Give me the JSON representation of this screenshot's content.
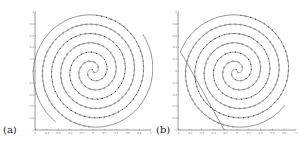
{
  "chart_data": [
    {
      "type": "scatter",
      "panel_label": "(a)",
      "title": "",
      "xlabel": "",
      "ylabel": "",
      "xlim": [
        -1,
        1
      ],
      "ylim": [
        -1,
        1
      ],
      "xticks": [
        "-1",
        "-0.8",
        "-0.6",
        "-0.4",
        "-0.2",
        "0",
        "0.2",
        "0.4",
        "0.6",
        "0.8",
        "1"
      ],
      "yticks": [
        "1",
        "0.8",
        "0.6",
        "0.4",
        "0.2",
        "0",
        "-0.2",
        "-0.4",
        "-0.6",
        "-0.8",
        "-1"
      ],
      "grid": false,
      "legend": null,
      "description": "Two interleaved spirals: points of class 1 as small filled dots, class 2 as small open circles; solid curve shows learned decision boundary spiral extending beyond top-right of frame",
      "series": [
        {
          "name": "class-1",
          "marker": "dot",
          "shape": "spiral",
          "phase_deg": 0,
          "turns": 3
        },
        {
          "name": "class-2",
          "marker": "circle",
          "shape": "spiral",
          "phase_deg": 180,
          "turns": 3
        },
        {
          "name": "decision-boundary",
          "marker": "line",
          "shape": "spiral",
          "phase_deg": 90,
          "turns": 3.4
        }
      ]
    },
    {
      "type": "scatter",
      "panel_label": "(b)",
      "title": "",
      "xlabel": "",
      "ylabel": "",
      "xlim": [
        -1,
        1
      ],
      "ylim": [
        -1,
        1
      ],
      "xticks": [
        "-1",
        "-0.8",
        "-0.6",
        "-0.4",
        "-0.2",
        "0",
        "0.2",
        "0.4",
        "0.6",
        "0.8",
        "1"
      ],
      "yticks": [
        "1",
        "0.8",
        "0.6",
        "0.4",
        "0.2",
        "0",
        "-0.2",
        "-0.4",
        "-0.6",
        "-0.8",
        "-1"
      ],
      "grid": false,
      "legend": null,
      "description": "Same two interleaved spirals; decision boundary spiral closes around data and ends near bottom-left of frame",
      "series": [
        {
          "name": "class-1",
          "marker": "dot",
          "shape": "spiral",
          "phase_deg": 0,
          "turns": 3
        },
        {
          "name": "class-2",
          "marker": "circle",
          "shape": "spiral",
          "phase_deg": 180,
          "turns": 3
        },
        {
          "name": "decision-boundary",
          "marker": "line",
          "shape": "spiral",
          "phase_deg": 90,
          "turns": 3.2
        }
      ]
    }
  ]
}
